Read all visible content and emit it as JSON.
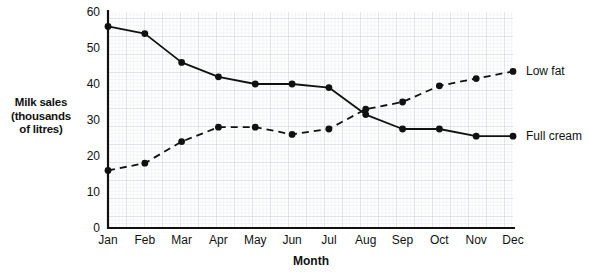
{
  "chart_data": {
    "type": "line",
    "title": "",
    "xlabel": "Month",
    "ylabel": "Milk sales (thousands of litres)",
    "ylabel_lines": [
      "Milk sales",
      "(thousands",
      "of litres)"
    ],
    "categories": [
      "Jan",
      "Feb",
      "Mar",
      "Apr",
      "May",
      "Jun",
      "Jul",
      "Aug",
      "Sep",
      "Oct",
      "Nov",
      "Dec"
    ],
    "yticks": [
      0,
      10,
      20,
      30,
      40,
      50,
      60
    ],
    "ylim": [
      0,
      60
    ],
    "grid": true,
    "legend_position": "right-inline",
    "series": [
      {
        "name": "Full cream",
        "style": "solid",
        "marker": "filled-circle",
        "values": [
          56,
          54,
          46,
          42,
          40,
          40,
          39,
          31.5,
          27.5,
          27.5,
          25.5,
          25.5
        ]
      },
      {
        "name": "Low fat",
        "style": "dashed",
        "marker": "filled-circle",
        "values": [
          16,
          18,
          24,
          28,
          28,
          26,
          27.5,
          33,
          35,
          39.5,
          41.5,
          43.5
        ]
      }
    ]
  },
  "colors": {
    "ink": "#111111",
    "grid_minor": "#d9dde0",
    "grid_major": "#b9c0c5",
    "background": "#ffffff"
  }
}
